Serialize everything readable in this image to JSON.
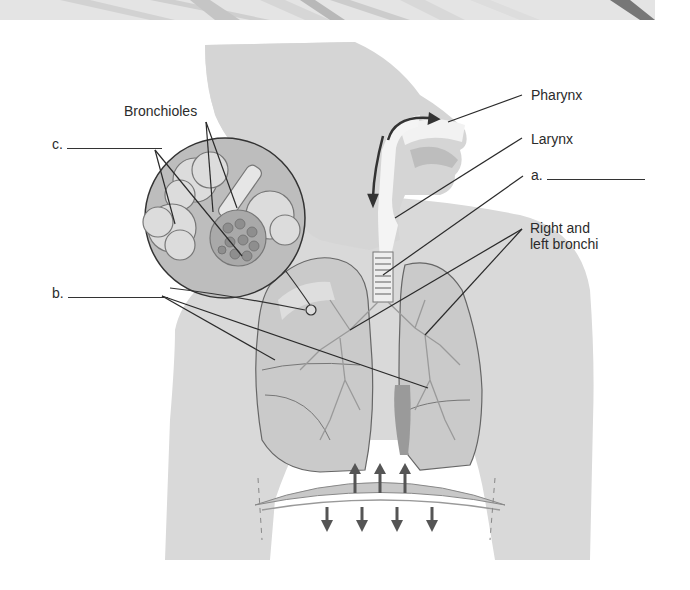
{
  "figure": {
    "inset_subject": "Alveoli cluster magnified"
  },
  "labels": {
    "bronchioles": "Bronchioles",
    "pharynx": "Pharynx",
    "larynx": "Larynx",
    "right_left_bronchi_line1": "Right and",
    "right_left_bronchi_line2": "left bronchi",
    "blank_a": "a.",
    "blank_b": "b.",
    "blank_c": "c."
  },
  "colors": {
    "body_fill": "#d9d9d9",
    "lung_fill": "#c9c9c9",
    "outline": "#555555",
    "leader_line": "#2a2a2a",
    "inset_fill": "#bdbdbd",
    "airway_white": "#f4f4f4"
  }
}
